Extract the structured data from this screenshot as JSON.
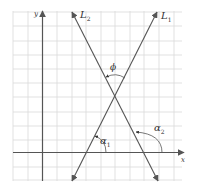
{
  "diagram": {
    "title": "",
    "axes": {
      "x_label": "x",
      "y_label": "y"
    },
    "lines": [
      {
        "id": "L1",
        "label": "L",
        "subscript": "1"
      },
      {
        "id": "L2",
        "label": "L",
        "subscript": "2"
      }
    ],
    "angles": [
      {
        "id": "alpha1",
        "label": "α",
        "subscript": "1",
        "description": "inclination of L1 measured from positive x-axis"
      },
      {
        "id": "alpha2",
        "label": "α",
        "subscript": "2",
        "description": "inclination of L2 measured from positive x-axis"
      },
      {
        "id": "phi",
        "label": "ϕ",
        "subscript": "",
        "description": "angle between L1 and L2"
      }
    ],
    "colors": {
      "grid": "#d9d9d9",
      "lines": "#555555",
      "text": "#333333",
      "background": "#ffffff"
    }
  }
}
